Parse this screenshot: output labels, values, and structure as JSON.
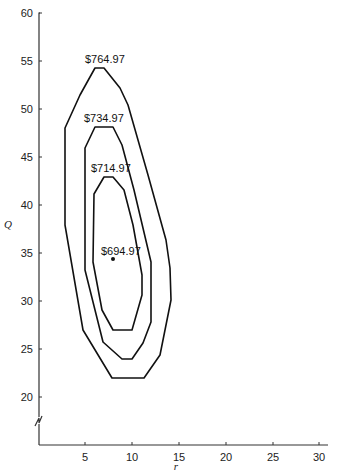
{
  "header": {
    "text": ""
  },
  "chart_data": {
    "type": "line",
    "title": "",
    "xlabel": "r",
    "ylabel": "Q",
    "xlim": [
      0,
      32
    ],
    "ylim": [
      17,
      60
    ],
    "grid": false,
    "legend": null,
    "x_ticks": [
      5,
      10,
      15,
      20,
      25,
      30
    ],
    "y_ticks": [
      20,
      25,
      30,
      35,
      40,
      45,
      50,
      55,
      60
    ],
    "axis_break": {
      "axis": "y",
      "between": [
        0,
        20
      ]
    },
    "series": [
      {
        "name": "$764.97",
        "kind": "contour",
        "points": [
          [
            6.0,
            54.3
          ],
          [
            7.0,
            54.3
          ],
          [
            8.7,
            52.2
          ],
          [
            9.5,
            50.4
          ],
          [
            14.0,
            33.4
          ],
          [
            14.1,
            30.1
          ],
          [
            13.0,
            24.4
          ],
          [
            11.3,
            22.0
          ],
          [
            7.8,
            22.0
          ],
          [
            4.7,
            27.0
          ],
          [
            2.8,
            37.9
          ],
          [
            2.8,
            48.0
          ]
        ]
      },
      {
        "name": "$734.97",
        "kind": "contour",
        "points": [
          [
            6.0,
            48.0
          ],
          [
            7.9,
            48.0
          ],
          [
            10.1,
            41.2
          ],
          [
            12.0,
            34.5
          ],
          [
            12.0,
            28.2
          ],
          [
            11.1,
            26.1
          ],
          [
            9.9,
            24.0
          ],
          [
            8.9,
            24.0
          ],
          [
            6.9,
            25.8
          ],
          [
            4.9,
            33.3
          ],
          [
            4.9,
            46.0
          ]
        ]
      },
      {
        "name": "$714.97",
        "kind": "contour",
        "points": [
          [
            6.9,
            42.8
          ],
          [
            7.9,
            42.8
          ],
          [
            9.1,
            41.2
          ],
          [
            10.1,
            37.6
          ],
          [
            11.0,
            32.4
          ],
          [
            11.0,
            30.3
          ],
          [
            9.9,
            26.9
          ],
          [
            7.9,
            26.9
          ],
          [
            6.8,
            29.0
          ],
          [
            5.9,
            35.0
          ],
          [
            5.9,
            41.0
          ]
        ]
      },
      {
        "name": "$694.97",
        "kind": "point",
        "points": [
          [
            7.9,
            34.3
          ]
        ]
      }
    ],
    "annotations": [
      {
        "text": "$764.97",
        "x": 7.0,
        "y": 55.3
      },
      {
        "text": "$734.97",
        "x": 7.2,
        "y": 49.2
      },
      {
        "text": "$714.97",
        "x": 7.4,
        "y": 44.0
      },
      {
        "text": "$694.97",
        "x": 8.2,
        "y": 35.2
      }
    ]
  },
  "render": {
    "axis": {
      "x0": 39,
      "y_bottom": 445,
      "y_top": 13,
      "x_right": 328
    },
    "x_tick_px": [
      85,
      132,
      179,
      226,
      273,
      319
    ],
    "y_tick_px": [
      397,
      349,
      301,
      253,
      205,
      157,
      109,
      61,
      13
    ],
    "x_tick_labels": [
      "5",
      "10",
      "15",
      "20",
      "25",
      "30"
    ],
    "y_tick_labels": [
      "20",
      "25",
      "30",
      "35",
      "40",
      "45",
      "50",
      "55",
      "60"
    ],
    "contours_px": [
      "95,68 104,68 120,88 128,105 148,175 166,240 170,268 171,300 160,355 144,378 112,378 83,330 65,225 65,128 80,95",
      "85,148 95,127 113,127 122,145 134,190 151,262 151,322 143,343 132,359 122,359 103,342 85,270",
      "94,194 104,177 113,177 124,190 133,225 142,275 142,295 132,330 113,330 102,310 93,262"
    ],
    "labels_px": [
      {
        "text": "$764.97",
        "x": 85,
        "y": 63
      },
      {
        "text": "$734.97",
        "x": 84,
        "y": 122
      },
      {
        "text": "$714.97",
        "x": 91,
        "y": 172
      },
      {
        "text": "$694.97",
        "x": 101,
        "y": 255
      }
    ],
    "dot_px": {
      "x": 113,
      "y": 259
    },
    "xlabel_px": {
      "x": 176,
      "y": 470
    },
    "ylabel_px": {
      "x": 4,
      "y": 228
    }
  }
}
